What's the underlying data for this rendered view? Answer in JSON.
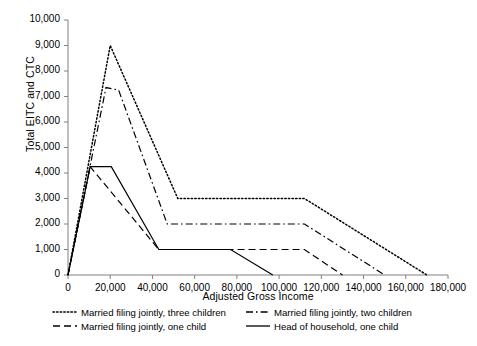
{
  "chart_data": {
    "type": "line",
    "title": "",
    "xlabel": "Adjusted Gross Income",
    "ylabel": "Total EITC and CTC",
    "xlim": [
      0,
      180000
    ],
    "ylim": [
      0,
      10000
    ],
    "grid": false,
    "legend_position": "bottom",
    "x_ticks": [
      0,
      20000,
      40000,
      60000,
      80000,
      100000,
      120000,
      140000,
      160000,
      180000
    ],
    "x_tick_labels": [
      "0",
      "20,000",
      "40,000",
      "60,000",
      "80,000",
      "100,000",
      "120,000",
      "140,000",
      "160,000",
      "180,000"
    ],
    "y_ticks": [
      0,
      1000,
      2000,
      3000,
      4000,
      5000,
      6000,
      7000,
      8000,
      9000,
      10000
    ],
    "y_tick_labels": [
      "0",
      "1,000",
      "2,000",
      "3,000",
      "4,000",
      "5,000",
      "6,000",
      "7,000",
      "8,000",
      "9,000",
      "10,000"
    ],
    "series": [
      {
        "name": "Married filing jointly, three children",
        "style": "dotted",
        "color": "#000000",
        "points": [
          [
            0,
            0
          ],
          [
            20000,
            9000
          ],
          [
            52000,
            3000
          ],
          [
            112000,
            3000
          ],
          [
            170000,
            0
          ]
        ]
      },
      {
        "name": "Married filing jointly, two children",
        "style": "dash-dot",
        "color": "#000000",
        "points": [
          [
            0,
            0
          ],
          [
            18000,
            7350
          ],
          [
            24000,
            7250
          ],
          [
            47000,
            2000
          ],
          [
            112000,
            2000
          ],
          [
            150000,
            0
          ]
        ]
      },
      {
        "name": "Married filing jointly, one child",
        "style": "dashed",
        "color": "#000000",
        "points": [
          [
            0,
            0
          ],
          [
            10500,
            4250
          ],
          [
            43000,
            1000
          ],
          [
            112000,
            1000
          ],
          [
            130000,
            0
          ]
        ]
      },
      {
        "name": "Head of household, one child",
        "style": "solid",
        "color": "#000000",
        "points": [
          [
            0,
            0
          ],
          [
            10500,
            4250
          ],
          [
            20500,
            4250
          ],
          [
            43000,
            1000
          ],
          [
            77000,
            1000
          ],
          [
            97000,
            0
          ]
        ]
      }
    ]
  },
  "axes": {
    "y_title": "Total EITC and CTC",
    "x_title": "Adjusted Gross Income"
  },
  "legend": {
    "entries": [
      {
        "label": "Married filing jointly, three children",
        "style": "dotted"
      },
      {
        "label": "Married filing jointly, two children",
        "style": "dash-dot"
      },
      {
        "label": "Married filing jointly, one child",
        "style": "dashed"
      },
      {
        "label": "Head of household, one child",
        "style": "solid"
      }
    ]
  }
}
